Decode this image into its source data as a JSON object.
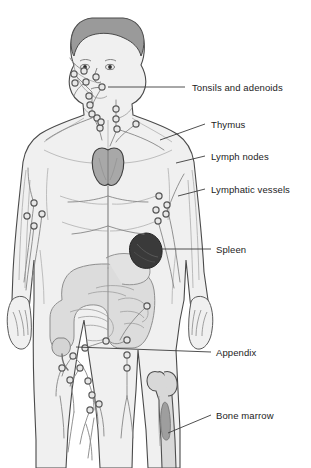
{
  "illustration": {
    "title": "The Lymphatic System",
    "subject": "human-body-lymphatic-anatomy",
    "background_color": "#ffffff",
    "body_fill": "#f0f0f0",
    "outline_color": "#4a4a4a",
    "vessel_color": "#8c8c8c",
    "node_fill": "#e8e8e8",
    "node_stroke": "#5a5a5a",
    "leader_color": "#3c3c3c",
    "text_color": "#1c1c1c"
  },
  "labels": [
    {
      "id": "tonsils",
      "text": "Tonsils and adenoids",
      "x": 192,
      "y": 83,
      "leader_x1": 185,
      "leader_y1": 87,
      "leader_x2": 108,
      "leader_y2": 87
    },
    {
      "id": "thymus",
      "text": "Thymus",
      "x": 211,
      "y": 120,
      "leader_x1": 205,
      "leader_y1": 124,
      "leader_x2": 160,
      "leader_y2": 140
    },
    {
      "id": "nodes",
      "text": "Lymph nodes",
      "x": 211,
      "y": 152,
      "leader_x1": 205,
      "leader_y1": 156,
      "leader_x2": 176,
      "leader_y2": 163
    },
    {
      "id": "vessels",
      "text": "Lymphatic vessels",
      "x": 211,
      "y": 185,
      "leader_x1": 205,
      "leader_y1": 189,
      "leader_x2": 178,
      "leader_y2": 196
    },
    {
      "id": "spleen",
      "text": "Spleen",
      "x": 216,
      "y": 245,
      "leader_x1": 211,
      "leader_y1": 249,
      "leader_x2": 161,
      "leader_y2": 249
    },
    {
      "id": "appendix",
      "text": "Appendix",
      "x": 216,
      "y": 348,
      "leader_x1": 211,
      "leader_y1": 352,
      "leader_x2": 76,
      "leader_y2": 347
    },
    {
      "id": "marrow",
      "text": "Bone marrow",
      "x": 216,
      "y": 411,
      "leader_x1": 211,
      "leader_y1": 415,
      "leader_x2": 168,
      "leader_y2": 433
    }
  ],
  "organs": {
    "hair_color": "#9a9a9a",
    "thymus_fill": "#a8a8a8",
    "spleen_fill": "#3a3a3a",
    "intestine_fill": "#dcdcdc",
    "bone_fill": "#d8d8d8",
    "marrow_fill": "#9e9e9e"
  },
  "lymph_nodes": [
    {
      "x": 74,
      "y": 74
    },
    {
      "x": 84,
      "y": 71
    },
    {
      "x": 75,
      "y": 83
    },
    {
      "x": 86,
      "y": 82
    },
    {
      "x": 96,
      "y": 77
    },
    {
      "x": 102,
      "y": 87
    },
    {
      "x": 89,
      "y": 96
    },
    {
      "x": 90,
      "y": 105
    },
    {
      "x": 92,
      "y": 114
    },
    {
      "x": 116,
      "y": 109
    },
    {
      "x": 116,
      "y": 119
    },
    {
      "x": 117,
      "y": 129
    },
    {
      "x": 97,
      "y": 118
    },
    {
      "x": 100,
      "y": 128
    },
    {
      "x": 136,
      "y": 124
    },
    {
      "x": 101,
      "y": 122
    },
    {
      "x": 34,
      "y": 203
    },
    {
      "x": 27,
      "y": 216
    },
    {
      "x": 42,
      "y": 214
    },
    {
      "x": 34,
      "y": 226
    },
    {
      "x": 159,
      "y": 196
    },
    {
      "x": 167,
      "y": 205
    },
    {
      "x": 156,
      "y": 210
    },
    {
      "x": 166,
      "y": 214
    },
    {
      "x": 158,
      "y": 221
    },
    {
      "x": 147,
      "y": 306
    },
    {
      "x": 85,
      "y": 348
    },
    {
      "x": 106,
      "y": 341
    },
    {
      "x": 127,
      "y": 340
    },
    {
      "x": 73,
      "y": 356
    },
    {
      "x": 62,
      "y": 368
    },
    {
      "x": 80,
      "y": 368
    },
    {
      "x": 70,
      "y": 380
    },
    {
      "x": 88,
      "y": 381
    },
    {
      "x": 127,
      "y": 355
    },
    {
      "x": 127,
      "y": 368
    },
    {
      "x": 92,
      "y": 395
    },
    {
      "x": 99,
      "y": 404
    },
    {
      "x": 90,
      "y": 410
    }
  ]
}
